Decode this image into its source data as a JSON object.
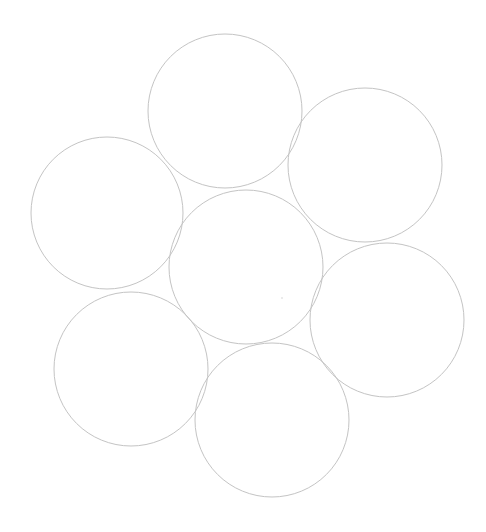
{
  "canvas": {
    "width": 486,
    "height": 532,
    "background": "#ffffff"
  },
  "style": {
    "stroke": "#c4c4c4",
    "stroke_width": 1,
    "fill": "none"
  },
  "circles": [
    {
      "name": "circle-top",
      "cx": 225,
      "cy": 111,
      "r": 77
    },
    {
      "name": "circle-upper-right",
      "cx": 365,
      "cy": 165,
      "r": 77
    },
    {
      "name": "circle-left",
      "cx": 107,
      "cy": 213,
      "r": 76
    },
    {
      "name": "circle-center",
      "cx": 246,
      "cy": 267,
      "r": 77
    },
    {
      "name": "circle-lower-right",
      "cx": 387,
      "cy": 320,
      "r": 77
    },
    {
      "name": "circle-lower-left",
      "cx": 131,
      "cy": 369,
      "r": 77
    },
    {
      "name": "circle-bottom",
      "cx": 272,
      "cy": 420,
      "r": 77
    }
  ],
  "dots": [
    {
      "name": "faint-dot",
      "cx": 282,
      "cy": 298,
      "r": 1,
      "color": "#e4e4e4"
    }
  ]
}
